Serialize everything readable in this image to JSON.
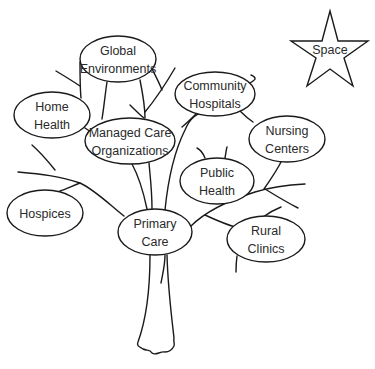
{
  "diagram": {
    "type": "tree-metaphor",
    "colors": {
      "stroke": "#1a1a1a",
      "text": "#2a2a2a",
      "background": "#ffffff"
    },
    "star": {
      "label": "Space",
      "cx": 330,
      "cy": 50
    },
    "nodes": [
      {
        "id": "global",
        "line1": "Global",
        "line2": "Environments",
        "cx": 118,
        "cy": 59,
        "rx": 38,
        "ry": 23
      },
      {
        "id": "home",
        "line1": "Home",
        "line2": "Health",
        "cx": 52,
        "cy": 115,
        "rx": 38,
        "ry": 23
      },
      {
        "id": "managed",
        "line1": "Managed Care",
        "line2": "Organizations",
        "cx": 130,
        "cy": 141,
        "rx": 45,
        "ry": 23
      },
      {
        "id": "community",
        "line1": "Community",
        "line2": "Hospitals",
        "cx": 215,
        "cy": 94,
        "rx": 40,
        "ry": 22
      },
      {
        "id": "nursing",
        "line1": "Nursing",
        "line2": "Centers",
        "cx": 287,
        "cy": 139,
        "rx": 38,
        "ry": 23
      },
      {
        "id": "public",
        "line1": "Public",
        "line2": "Health",
        "cx": 217,
        "cy": 181,
        "rx": 37,
        "ry": 23
      },
      {
        "id": "hospices",
        "line1": "Hospices",
        "line2": "",
        "cx": 45,
        "cy": 213,
        "rx": 38,
        "ry": 23
      },
      {
        "id": "primary",
        "line1": "Primary",
        "line2": "Care",
        "cx": 155,
        "cy": 232,
        "rx": 37,
        "ry": 23
      },
      {
        "id": "rural",
        "line1": "Rural",
        "line2": "Clinics",
        "cx": 266,
        "cy": 239,
        "rx": 39,
        "ry": 23
      }
    ]
  }
}
